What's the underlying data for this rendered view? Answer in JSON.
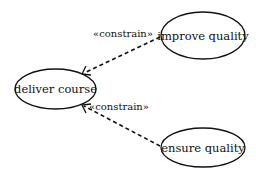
{
  "diagram": {
    "type": "use-case",
    "nodes": [
      {
        "id": "deliver",
        "label": "deliver course",
        "cx": 55.5,
        "cy": 89,
        "rx": 40.5,
        "ry": 20
      },
      {
        "id": "improve",
        "label": "improve quality",
        "cx": 203,
        "cy": 35.5,
        "rx": 42,
        "ry": 23.5
      },
      {
        "id": "ensure",
        "label": "ensure quality",
        "cx": 203,
        "cy": 147.5,
        "rx": 42,
        "ry": 19.5
      }
    ],
    "edges": [
      {
        "from": "improve",
        "to": "deliver",
        "style": "dashed",
        "arrow": "open",
        "stereotype": "«constrain»"
      },
      {
        "from": "ensure",
        "to": "deliver",
        "style": "dashed",
        "arrow": "open",
        "stereotype": "«constrain»"
      }
    ]
  },
  "labels": {
    "deliver": "deliver course",
    "improve": "improve quality",
    "ensure": "ensure quality",
    "edge_top": "«constrain»",
    "edge_bottom": "«constrain»"
  }
}
